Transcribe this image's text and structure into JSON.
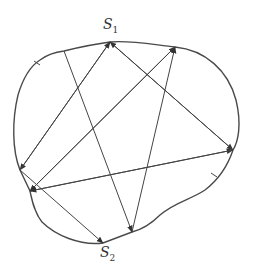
{
  "diagram": {
    "title": "",
    "labels": [
      {
        "id": "S1",
        "text": "S",
        "sub": "1",
        "x": 103,
        "y": 16
      },
      {
        "id": "S2",
        "text": "S",
        "sub": "2",
        "x": 100,
        "y": 244
      }
    ],
    "boundary": {
      "stroke": "#4a4a4a"
    },
    "points": {
      "S1": [
        110,
        42
      ],
      "TL": [
        64,
        51
      ],
      "TR": [
        175,
        47
      ],
      "R": [
        233,
        150
      ],
      "LA": [
        20,
        170
      ],
      "LB": [
        30,
        191
      ],
      "S2": [
        103,
        243
      ],
      "BR": [
        132,
        232
      ]
    },
    "arrows": [
      {
        "from": "TL",
        "to": "BR"
      },
      {
        "from": "S1",
        "to": "LA"
      },
      {
        "from": "LA",
        "to": "S1"
      },
      {
        "from": "S1",
        "to": "R"
      },
      {
        "from": "R",
        "to": "S1"
      },
      {
        "from": "LB",
        "to": "TR"
      },
      {
        "from": "TR",
        "to": "LB"
      },
      {
        "from": "BR",
        "to": "TR"
      },
      {
        "from": "LB",
        "to": "R"
      },
      {
        "from": "R",
        "to": "LB"
      },
      {
        "from": "LA",
        "to": "S2"
      }
    ],
    "ticks": [
      [
        37,
        63
      ],
      [
        214,
        175
      ]
    ]
  }
}
